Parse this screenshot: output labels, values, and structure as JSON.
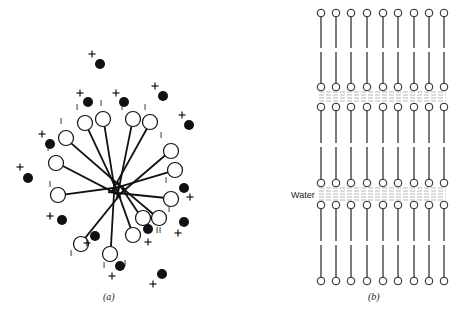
{
  "panel_a": {
    "caption": "(a)",
    "description": "Micelle: lipid molecules with polar heads outward, tails inward; counter-ions around",
    "center": [
      118,
      190
    ],
    "heads": [
      {
        "x": 103,
        "y": 119,
        "charge": "I",
        "cx": 101,
        "cy": 106
      },
      {
        "x": 85,
        "y": 123,
        "charge": "I",
        "cx": 77,
        "cy": 110
      },
      {
        "x": 66,
        "y": 138,
        "charge": "I",
        "cx": 61,
        "cy": 124
      },
      {
        "x": 56,
        "y": 163,
        "charge": "I",
        "cx": 48,
        "cy": 151
      },
      {
        "x": 58,
        "y": 195,
        "charge": "I",
        "cx": 50,
        "cy": 187
      },
      {
        "x": 81,
        "y": 244,
        "charge": "I",
        "cx": 71,
        "cy": 256
      },
      {
        "x": 110,
        "y": 254,
        "charge": "I",
        "cx": 104,
        "cy": 268
      },
      {
        "x": 133,
        "y": 235,
        "charge": "I",
        "cx": 125,
        "cy": 266
      },
      {
        "x": 159,
        "y": 218,
        "charge": "I",
        "cx": 157,
        "cy": 233
      },
      {
        "x": 171,
        "y": 199,
        "charge": "I",
        "cx": 169,
        "cy": 212
      },
      {
        "x": 175,
        "y": 170,
        "charge": "I",
        "cx": 166,
        "cy": 183
      },
      {
        "x": 171,
        "y": 151,
        "charge": "I",
        "cx": 161,
        "cy": 138
      },
      {
        "x": 150,
        "y": 122,
        "charge": "I",
        "cx": 145,
        "cy": 110
      },
      {
        "x": 133,
        "y": 119,
        "charge": "I",
        "cx": 122,
        "cy": 110
      },
      {
        "x": 143,
        "y": 218,
        "charge": "I",
        "cx": 160,
        "cy": 233
      }
    ],
    "counter_ions": [
      {
        "dot": [
          100,
          64
        ],
        "plus": [
          92,
          54
        ]
      },
      {
        "dot": [
          88,
          102
        ],
        "plus": [
          80,
          93
        ]
      },
      {
        "dot": [
          124,
          102
        ],
        "plus": [
          116,
          93
        ]
      },
      {
        "dot": [
          163,
          96
        ],
        "plus": [
          155,
          86
        ]
      },
      {
        "dot": [
          189,
          125
        ],
        "plus": [
          182,
          115
        ]
      },
      {
        "dot": [
          50,
          144
        ],
        "plus": [
          42,
          134
        ]
      },
      {
        "dot": [
          28,
          178
        ],
        "plus": [
          20,
          167
        ]
      },
      {
        "dot": [
          184,
          188
        ],
        "plus": [
          190,
          197
        ]
      },
      {
        "dot": [
          184,
          222
        ],
        "plus": [
          178,
          233
        ]
      },
      {
        "dot": [
          62,
          220
        ],
        "plus": [
          50,
          216
        ]
      },
      {
        "dot": [
          95,
          236
        ],
        "plus": [
          87,
          243
        ]
      },
      {
        "dot": [
          148,
          229
        ],
        "plus": [
          148,
          242
        ]
      },
      {
        "dot": [
          120,
          266
        ],
        "plus": [
          112,
          276
        ]
      },
      {
        "dot": [
          162,
          274
        ],
        "plus": [
          153,
          284
        ]
      }
    ]
  },
  "panel_b": {
    "caption": "(b)",
    "description": "Lamellar phase: stacked lipid bilayers separated by water layers",
    "water_label": "Water",
    "columns_x": [
      321,
      336,
      351,
      367,
      383,
      398,
      414,
      429,
      444
    ],
    "bilayers": [
      {
        "top_head_y": 13,
        "bottom_head_y": 87
      },
      {
        "top_head_y": 107,
        "bottom_head_y": 183
      },
      {
        "top_head_y": 205,
        "bottom_head_y": 281
      }
    ],
    "water_layers": [
      {
        "y_top": 92,
        "y_bottom": 102
      },
      {
        "y_top": 188,
        "y_bottom": 200
      }
    ]
  }
}
